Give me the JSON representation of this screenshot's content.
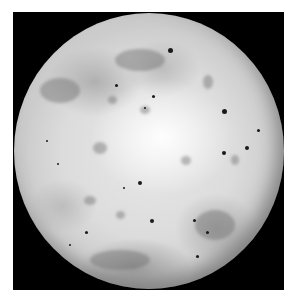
{
  "image": {
    "subject": "Io (moon of Jupiter), grayscale photograph",
    "background_color": "#ffffff",
    "frame_color": "#000000",
    "surface_colors": {
      "bright": "#f2f2f2",
      "mid": "#cfcfcf",
      "dark_patch": "#8a8a8a",
      "spot": "#1a1a1a"
    }
  },
  "features": {
    "dark_spots": [
      {
        "x": 170,
        "y": 50,
        "r": 2.5
      },
      {
        "x": 116,
        "y": 85,
        "r": 1.5
      },
      {
        "x": 153,
        "y": 96,
        "r": 1.5
      },
      {
        "x": 224,
        "y": 111,
        "r": 2.5
      },
      {
        "x": 47,
        "y": 141,
        "r": 1.2
      },
      {
        "x": 224,
        "y": 153,
        "r": 2
      },
      {
        "x": 247,
        "y": 148,
        "r": 2
      },
      {
        "x": 258,
        "y": 130,
        "r": 1.5
      },
      {
        "x": 140,
        "y": 183,
        "r": 2
      },
      {
        "x": 152,
        "y": 221,
        "r": 2.2
      },
      {
        "x": 207,
        "y": 232,
        "r": 1.5
      },
      {
        "x": 194,
        "y": 220,
        "r": 1.5
      },
      {
        "x": 86,
        "y": 232,
        "r": 1.5
      },
      {
        "x": 70,
        "y": 245,
        "r": 1.3
      },
      {
        "x": 197,
        "y": 256,
        "r": 1.5
      },
      {
        "x": 124,
        "y": 188,
        "r": 1.2
      },
      {
        "x": 58,
        "y": 164,
        "r": 1.2
      },
      {
        "x": 145,
        "y": 108,
        "r": 1.3
      }
    ],
    "grey_patches": [
      {
        "x": 100,
        "y": 148,
        "w": 14,
        "h": 12
      },
      {
        "x": 186,
        "y": 160,
        "w": 10,
        "h": 9
      },
      {
        "x": 145,
        "y": 110,
        "w": 10,
        "h": 8
      },
      {
        "x": 112,
        "y": 100,
        "w": 9,
        "h": 8
      },
      {
        "x": 208,
        "y": 82,
        "w": 10,
        "h": 14
      },
      {
        "x": 90,
        "y": 200,
        "w": 12,
        "h": 9
      },
      {
        "x": 120,
        "y": 215,
        "w": 9,
        "h": 8
      },
      {
        "x": 235,
        "y": 160,
        "w": 8,
        "h": 10
      },
      {
        "x": 60,
        "y": 90,
        "w": 40,
        "h": 25
      },
      {
        "x": 140,
        "y": 60,
        "w": 50,
        "h": 22
      },
      {
        "x": 120,
        "y": 260,
        "w": 60,
        "h": 20
      },
      {
        "x": 215,
        "y": 225,
        "w": 40,
        "h": 30
      }
    ]
  }
}
